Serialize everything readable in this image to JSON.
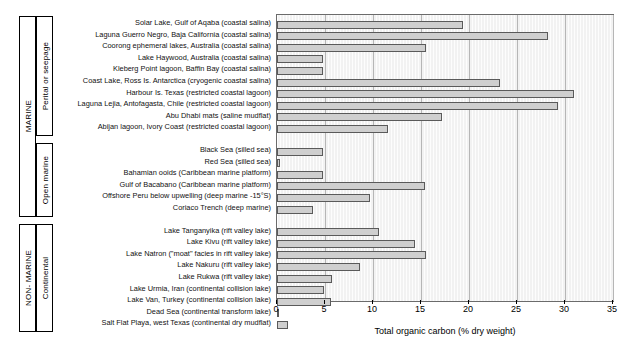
{
  "chart_data": {
    "type": "bar",
    "orientation": "horizontal",
    "title": "",
    "xlabel": "Total organic carbon (% dry weight)",
    "ylabel": "",
    "xlim": [
      0,
      35
    ],
    "xticks": [
      0,
      5,
      10,
      15,
      20,
      25,
      30,
      35
    ],
    "xticklabels": [
      "0",
      "5",
      "10",
      "15",
      "20",
      "25",
      "30",
      "35"
    ],
    "grid": true,
    "legend": "none",
    "groups": [
      {
        "outer_label": "MARINE",
        "inner_label": "Perital or seepage",
        "categories": [
          "Solar Lake, Gulf of Aqaba (coastal salina)",
          "Laguna Guerro Negro, Baja California (coastal salina)",
          "Coorong ephemeral lakes, Australia (coastal salina)",
          "Lake Haywood, Australia (coastal salina)",
          "Kleberg Point lagoon, Baffin Bay (coastal salina)",
          "Coast Lake, Ross Is. Antarctica (cryogenic coastal salina)",
          "Harbour Is. Texas (restricted coastal lagoon)",
          "Laguna Lejia, Antofagasta, Chile (restricted coastal lagoon)",
          "Abu Dhabi mats (saline mudflat)",
          "Abijan lagoon, Ivory Coast (restricted coastal lagoon)"
        ],
        "values": [
          19.4,
          28.2,
          15.5,
          4.8,
          4.8,
          23.2,
          30.9,
          29.3,
          17.2,
          11.6
        ]
      },
      {
        "outer_label": "MARINE",
        "inner_label": "Open marine",
        "categories": [
          "Black Sea (silled sea)",
          "Red Sea (silled sea)",
          "Bahamian ooids (Caribbean marine platform)",
          "Gulf of Bacabano (Caribbean marine platform)",
          "Offshore Peru below upwelling (deep marine -15°S)",
          "Coriaco Trench (deep marine)"
        ],
        "values": [
          4.8,
          0.3,
          4.8,
          15.4,
          9.7,
          3.8
        ]
      },
      {
        "outer_label": "NON- MARINE",
        "inner_label": "Continental",
        "categories": [
          "Lake Tanganyika (rift valley lake)",
          "Lake Kivu (rift valley lake)",
          "Lake Natron (\"moat\" facies in rift valley lake)",
          "Lake Nakuru (rift valley lake)",
          "Lake Rukwa (rift valley lake)",
          "Lake Urmia, Iran (continental collision lake)",
          "Lake Van, Turkey (continental collision lake)",
          "Dead Sea (continental transform lake)",
          "Salt Flat Playa, west Texas (continental dry mudflat)"
        ],
        "values": [
          10.6,
          14.4,
          15.5,
          8.6,
          5.7,
          4.9,
          5.6,
          0.2,
          1.1
        ]
      }
    ]
  },
  "colors": {
    "bar_fill": "#cfcfcf",
    "bar_edge": "#5a5a5a",
    "plot_bg": "#f2f2f2",
    "gridline": "#b6b6b6",
    "axis": "#000000"
  }
}
